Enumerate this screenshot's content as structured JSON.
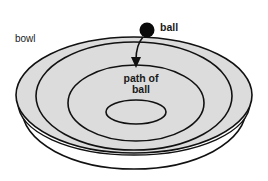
{
  "diagram": {
    "title": "",
    "labels": {
      "bowl": "bowl",
      "ball": "ball",
      "path_line1": "path of",
      "path_line2": "ball"
    },
    "colors": {
      "bowl_fill": "#dcdcdc",
      "stroke": "#111111",
      "ball": "#0a0a0a",
      "background": "#ffffff"
    },
    "shapes": {
      "bowl_base": {
        "cx": 134,
        "cy": 109,
        "rx": 112,
        "ry": 60
      },
      "bowl_rim_lower": {
        "cx": 134,
        "cy": 103,
        "rx": 116,
        "ry": 52
      },
      "bowl_rim": {
        "cx": 134,
        "cy": 95,
        "rx": 118,
        "ry": 58
      },
      "path_outer": {
        "cx": 134,
        "cy": 96,
        "rx": 98,
        "ry": 54
      },
      "path_middle": {
        "cx": 136,
        "cy": 103,
        "rx": 68,
        "ry": 38
      },
      "path_inner": {
        "cx": 136,
        "cy": 112,
        "rx": 30,
        "ry": 12
      },
      "ball": {
        "cx": 147,
        "cy": 30,
        "r": 7.5
      },
      "arrow": {
        "path": "M 143 37 Q 136 45 136 60",
        "head": "131,57 141,57 136,68"
      }
    }
  }
}
